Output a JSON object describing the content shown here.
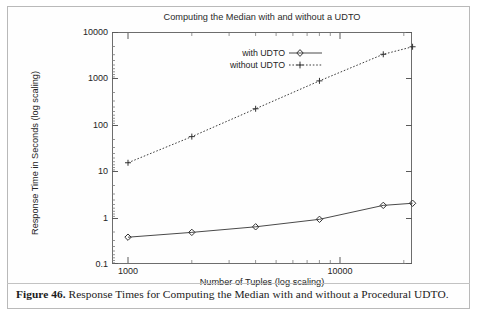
{
  "figure": {
    "caption_number": "Figure 46.",
    "caption_text": "Response Times for Computing the Median with and without a Procedural UDTO."
  },
  "chart_data": {
    "type": "line",
    "title": "Computing the Median with and without a UDTO",
    "xlabel": "Number of Tuples (log scaling)",
    "ylabel": "Response Time in Seconds (log scaling)",
    "xscale": "log",
    "yscale": "log",
    "xlim": [
      800,
      25000
    ],
    "ylim": [
      0.1,
      10000
    ],
    "grid": false,
    "legend_position": "upper center",
    "xticks": [
      1000,
      10000
    ],
    "xtick_labels": [
      "1000",
      "10000"
    ],
    "yticks": [
      0.1,
      1,
      10,
      100,
      1000,
      10000
    ],
    "ytick_labels": [
      "0.1",
      "1",
      "10",
      "100",
      "1000",
      "10000"
    ],
    "x": [
      1000,
      2000,
      4000,
      8000,
      16000,
      22000
    ],
    "series": [
      {
        "name": "with UDTO",
        "style": "solid",
        "marker": "diamond",
        "color": "#3a3a3a",
        "values": [
          0.37,
          0.47,
          0.62,
          0.9,
          1.8,
          2.0
        ]
      },
      {
        "name": "without UDTO",
        "style": "dotted",
        "marker": "plus",
        "color": "#3a3a3a",
        "values": [
          15,
          55,
          220,
          880,
          3300,
          4800
        ]
      }
    ]
  }
}
